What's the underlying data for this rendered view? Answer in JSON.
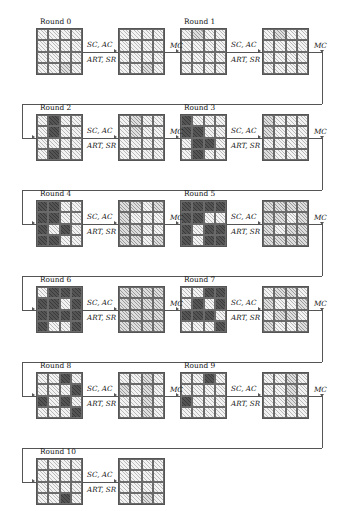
{
  "figure": {
    "type": "aes-differential-trail",
    "state_size": "4x4",
    "cell_legend": {
      "0": "inactive-light-hatched",
      "1": "active-dark",
      "2": "medium-crosshatched"
    },
    "operations": {
      "sc_ac": "SC, AC",
      "art_sr": "ART, SR",
      "mc": "MC"
    },
    "round_label_prefix": "Round"
  },
  "rounds": [
    {
      "label": "Round 0",
      "states": [
        {
          "name": "state-a",
          "cells": [
            [
              0,
              0,
              0,
              0
            ],
            [
              0,
              0,
              0,
              0
            ],
            [
              0,
              0,
              0,
              0
            ],
            [
              0,
              0,
              2,
              0
            ]
          ]
        },
        {
          "name": "state-b",
          "cells": [
            [
              0,
              0,
              0,
              0
            ],
            [
              0,
              0,
              0,
              0
            ],
            [
              0,
              0,
              0,
              0
            ],
            [
              0,
              0,
              2,
              0
            ]
          ]
        }
      ],
      "labels": {
        "sc_ac": "SC, AC",
        "art_sr": "ART, SR",
        "mc": "MC"
      }
    },
    {
      "label": "Round 1",
      "states": [
        {
          "name": "state-a",
          "cells": [
            [
              0,
              2,
              0,
              0
            ],
            [
              0,
              0,
              0,
              0
            ],
            [
              0,
              0,
              0,
              0
            ],
            [
              0,
              0,
              0,
              0
            ]
          ]
        },
        {
          "name": "state-b",
          "cells": [
            [
              0,
              2,
              0,
              0
            ],
            [
              0,
              0,
              0,
              0
            ],
            [
              0,
              0,
              0,
              0
            ],
            [
              0,
              0,
              0,
              0
            ]
          ]
        }
      ],
      "labels": {
        "sc_ac": "SC, AC",
        "art_sr": "ART, SR",
        "mc": "MC"
      }
    },
    {
      "label": "Round 2",
      "states": [
        {
          "name": "state-a",
          "cells": [
            [
              0,
              1,
              0,
              0
            ],
            [
              0,
              1,
              0,
              0
            ],
            [
              0,
              0,
              0,
              0
            ],
            [
              0,
              1,
              0,
              0
            ]
          ]
        },
        {
          "name": "state-b",
          "cells": [
            [
              0,
              2,
              0,
              0
            ],
            [
              0,
              2,
              0,
              0
            ],
            [
              0,
              0,
              0,
              0
            ],
            [
              0,
              0,
              0,
              0
            ]
          ]
        }
      ],
      "labels": {
        "sc_ac": "SC, AC",
        "art_sr": "ART, SR",
        "mc": "MC"
      }
    },
    {
      "label": "Round 3",
      "states": [
        {
          "name": "state-a",
          "cells": [
            [
              1,
              0,
              0,
              0
            ],
            [
              1,
              1,
              0,
              0
            ],
            [
              0,
              1,
              1,
              0
            ],
            [
              0,
              1,
              0,
              0
            ]
          ]
        },
        {
          "name": "state-b",
          "cells": [
            [
              2,
              0,
              0,
              0
            ],
            [
              2,
              0,
              0,
              0
            ],
            [
              0,
              0,
              0,
              0
            ],
            [
              2,
              0,
              0,
              0
            ]
          ]
        }
      ],
      "labels": {
        "sc_ac": "SC, AC",
        "art_sr": "ART, SR",
        "mc": "MC"
      }
    },
    {
      "label": "Round 4",
      "states": [
        {
          "name": "state-a",
          "cells": [
            [
              1,
              1,
              0,
              0
            ],
            [
              1,
              1,
              0,
              0
            ],
            [
              1,
              0,
              1,
              0
            ],
            [
              1,
              1,
              0,
              0
            ]
          ]
        },
        {
          "name": "state-b",
          "cells": [
            [
              2,
              2,
              0,
              2
            ],
            [
              2,
              0,
              0,
              0
            ],
            [
              2,
              2,
              0,
              0
            ],
            [
              2,
              2,
              0,
              2
            ]
          ]
        }
      ],
      "labels": {
        "sc_ac": "SC, AC",
        "art_sr": "ART, SR",
        "mc": "MC"
      }
    },
    {
      "label": "Round 5",
      "states": [
        {
          "name": "state-a",
          "cells": [
            [
              1,
              1,
              1,
              1
            ],
            [
              1,
              1,
              0,
              0
            ],
            [
              1,
              0,
              1,
              1
            ],
            [
              1,
              0,
              1,
              1
            ]
          ]
        },
        {
          "name": "state-b",
          "cells": [
            [
              2,
              2,
              2,
              2
            ],
            [
              2,
              2,
              0,
              2
            ],
            [
              2,
              0,
              2,
              2
            ],
            [
              2,
              2,
              2,
              2
            ]
          ]
        }
      ],
      "labels": {
        "sc_ac": "SC, AC",
        "art_sr": "ART, SR",
        "mc": "MC"
      }
    },
    {
      "label": "Round 6",
      "states": [
        {
          "name": "state-a",
          "cells": [
            [
              0,
              1,
              1,
              1
            ],
            [
              1,
              1,
              0,
              1
            ],
            [
              1,
              1,
              1,
              1
            ],
            [
              1,
              0,
              0,
              1
            ]
          ]
        },
        {
          "name": "state-b",
          "cells": [
            [
              2,
              2,
              2,
              2
            ],
            [
              2,
              2,
              2,
              2
            ],
            [
              2,
              2,
              2,
              2
            ],
            [
              2,
              2,
              2,
              2
            ]
          ]
        }
      ],
      "labels": {
        "sc_ac": "SC, AC",
        "art_sr": "ART, SR",
        "mc": "MC"
      }
    },
    {
      "label": "Round 7",
      "states": [
        {
          "name": "state-a",
          "cells": [
            [
              0,
              0,
              1,
              1
            ],
            [
              0,
              1,
              0,
              1
            ],
            [
              1,
              1,
              1,
              0
            ],
            [
              0,
              0,
              0,
              1
            ]
          ]
        },
        {
          "name": "state-b",
          "cells": [
            [
              0,
              2,
              2,
              0
            ],
            [
              2,
              0,
              0,
              2
            ],
            [
              0,
              2,
              2,
              0
            ],
            [
              2,
              0,
              0,
              2
            ]
          ]
        }
      ],
      "labels": {
        "sc_ac": "SC, AC",
        "art_sr": "ART, SR",
        "mc": "MC"
      }
    },
    {
      "label": "Round 8",
      "states": [
        {
          "name": "state-a",
          "cells": [
            [
              0,
              0,
              1,
              0
            ],
            [
              0,
              0,
              0,
              1
            ],
            [
              1,
              0,
              1,
              0
            ],
            [
              0,
              0,
              0,
              1
            ]
          ]
        },
        {
          "name": "state-b",
          "cells": [
            [
              0,
              0,
              2,
              0
            ],
            [
              2,
              0,
              2,
              0
            ],
            [
              0,
              0,
              2,
              0
            ],
            [
              0,
              0,
              2,
              0
            ]
          ]
        }
      ],
      "labels": {
        "sc_ac": "SC, AC",
        "art_sr": "ART, SR",
        "mc": "MC"
      }
    },
    {
      "label": "Round 9",
      "states": [
        {
          "name": "state-a",
          "cells": [
            [
              0,
              0,
              1,
              0
            ],
            [
              0,
              0,
              0,
              0
            ],
            [
              1,
              0,
              0,
              0
            ],
            [
              0,
              0,
              0,
              0
            ]
          ]
        },
        {
          "name": "state-b",
          "cells": [
            [
              0,
              0,
              2,
              0
            ],
            [
              0,
              0,
              2,
              0
            ],
            [
              0,
              0,
              2,
              0
            ],
            [
              0,
              0,
              0,
              0
            ]
          ]
        }
      ],
      "labels": {
        "sc_ac": "SC, AC",
        "art_sr": "ART, SR",
        "mc": "MC"
      }
    },
    {
      "label": "Round 10",
      "states": [
        {
          "name": "state-a",
          "cells": [
            [
              0,
              0,
              0,
              0
            ],
            [
              0,
              0,
              0,
              0
            ],
            [
              0,
              0,
              0,
              0
            ],
            [
              0,
              0,
              1,
              0
            ]
          ]
        },
        {
          "name": "state-b",
          "cells": [
            [
              0,
              0,
              0,
              0
            ],
            [
              0,
              0,
              0,
              0
            ],
            [
              0,
              0,
              0,
              0
            ],
            [
              0,
              0,
              2,
              0
            ]
          ]
        }
      ],
      "labels": {
        "sc_ac": "SC, AC",
        "art_sr": "ART, SR",
        "mc": ""
      }
    }
  ]
}
